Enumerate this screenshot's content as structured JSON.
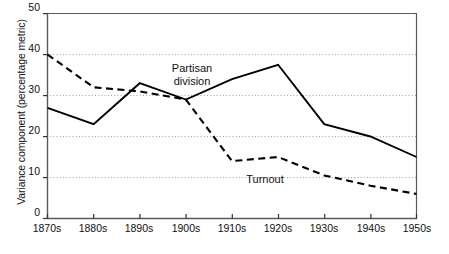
{
  "chart_data": {
    "type": "line",
    "title": "",
    "xlabel": "",
    "ylabel": "Variance component (percentage metric)",
    "categories": [
      "1870s",
      "1880s",
      "1890s",
      "1900s",
      "1910s",
      "1920s",
      "1930s",
      "1940s",
      "1950s"
    ],
    "xlim": [
      0,
      8
    ],
    "ylim": [
      0,
      50
    ],
    "yticks": [
      0,
      10,
      20,
      30,
      40,
      50
    ],
    "ytick_labels": [
      "0",
      "10",
      "20",
      "30",
      "40",
      "50"
    ],
    "grid": "horizontal-dotted",
    "legend": "inline-annotations",
    "series": [
      {
        "name": "Partisan division",
        "style": "solid",
        "color": "#000000",
        "values": [
          27,
          23,
          33,
          29,
          34,
          37.5,
          23,
          20,
          15
        ]
      },
      {
        "name": "Turnout",
        "style": "dashed",
        "color": "#000000",
        "values": [
          40,
          32,
          31,
          29,
          14,
          15,
          10.5,
          8,
          6
        ]
      }
    ],
    "annotations": [
      {
        "text_line1": "Partisan",
        "text_line2": "division",
        "x_category": "1900s",
        "y_value": 42
      },
      {
        "text_line1": "Turnout",
        "text_line2": "",
        "x_category": "1910s",
        "y_value": 12
      }
    ]
  },
  "axis": {
    "y_tick_0": "0",
    "y_tick_1": "10",
    "y_tick_2": "20",
    "y_tick_3": "30",
    "y_tick_4": "40",
    "y_tick_5": "50",
    "x_tick_0": "1870s",
    "x_tick_1": "1880s",
    "x_tick_2": "1890s",
    "x_tick_3": "1900s",
    "x_tick_4": "1910s",
    "x_tick_5": "1920s",
    "x_tick_6": "1930s",
    "x_tick_7": "1940s",
    "x_tick_8": "1950s",
    "y_axis_title": "Variance component (percentage metric)"
  },
  "labels": {
    "partisan_line1": "Partisan",
    "partisan_line2": "division",
    "turnout": "Turnout"
  },
  "colors": {
    "line": "#000000",
    "axis": "#555555",
    "grid": "#9a9a9a",
    "background": "#ffffff"
  }
}
